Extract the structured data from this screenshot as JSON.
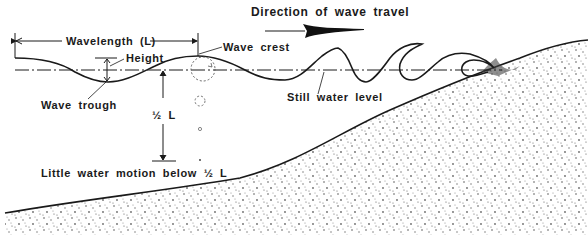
{
  "diagram": {
    "type": "wave anatomy cross-section",
    "labels": {
      "direction": "Direction of wave travel",
      "wavelength": "Wavelength (L)",
      "height": "Height",
      "wave_crest": "Wave crest",
      "wave_trough": "Wave trough",
      "still_water_level": "Still water level",
      "half_l": "½  L",
      "little_motion": "Little water motion below ½  L"
    },
    "colors": {
      "ink": "#1a1a1a",
      "background": "#ffffff",
      "sand_dots": "#555555"
    }
  }
}
